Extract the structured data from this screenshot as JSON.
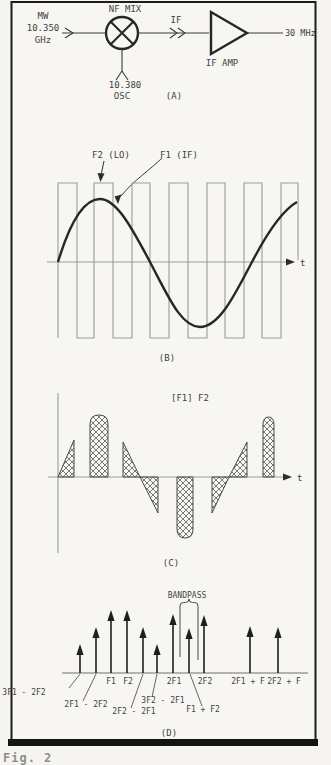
{
  "panel_a": {
    "label": "(A)",
    "input_line1": "MW",
    "input_line2": "10.350",
    "input_line3": "GHz",
    "mixer_label": "NF MIX",
    "if_label": "IF",
    "amp_label": "IF AMP",
    "output_label": "30 MHz",
    "osc_line1": "10.380",
    "osc_line2": "OSC"
  },
  "panel_b": {
    "label": "(B)",
    "lo_label": "F2 (LO)",
    "if_label": "F1 (IF)",
    "axis_label": "t"
  },
  "panel_c": {
    "label": "(C)",
    "title": "[F1] F2",
    "axis_label": "t"
  },
  "panel_d": {
    "label": "(D)",
    "bandpass_label": "BANDPASS",
    "arrows": [
      {
        "label": "3F1 - 2F2",
        "x": 80,
        "top": 644,
        "lx": 24,
        "ly": 695,
        "leader": [
          80,
          674,
          69,
          688
        ]
      },
      {
        "label": "2F1 - 2F2",
        "x": 96,
        "top": 627,
        "lx": 86,
        "ly": 707,
        "leader": [
          96,
          674,
          83,
          701
        ]
      },
      {
        "label": "F1",
        "x": 111,
        "top": 610,
        "lx": 111,
        "ly": 684
      },
      {
        "label": "F2",
        "x": 127,
        "top": 610,
        "lx": 128,
        "ly": 684
      },
      {
        "label": "2F2 - 2F1",
        "x": 143,
        "top": 627,
        "lx": 134,
        "ly": 714,
        "leader": [
          143,
          674,
          131,
          708
        ]
      },
      {
        "label": "3F2 - 2F1",
        "x": 157,
        "top": 644,
        "lx": 163,
        "ly": 703,
        "leader": [
          157,
          674,
          152,
          697
        ]
      },
      {
        "label": "2F1",
        "x": 173,
        "top": 614,
        "lx": 174,
        "ly": 684
      },
      {
        "label": "F1 + F2",
        "x": 189,
        "top": 628,
        "lx": 203,
        "ly": 712,
        "leader": [
          190,
          674,
          202,
          706
        ]
      },
      {
        "label": "2F2",
        "x": 204,
        "top": 615,
        "lx": 205,
        "ly": 684
      },
      {
        "label": "2F1 + F",
        "x": 250,
        "top": 626,
        "lx": 248,
        "ly": 684
      },
      {
        "label": "2F2 + F",
        "x": 278,
        "top": 627,
        "lx": 284,
        "ly": 684
      }
    ]
  },
  "caption_fragment": "Fig. 2"
}
